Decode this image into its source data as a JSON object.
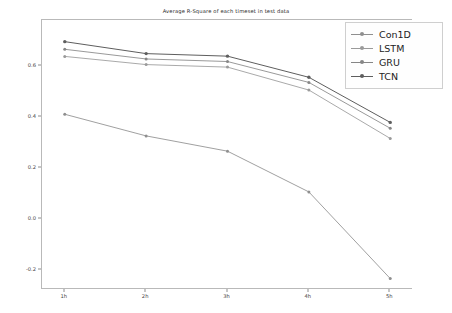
{
  "chart_data": {
    "type": "line",
    "title": "Average R-Square of each timeset in test data",
    "xlabel": "",
    "ylabel": "",
    "categories": [
      "1h",
      "2h",
      "3h",
      "4h",
      "5h"
    ],
    "x_tick_labels": [
      "1h",
      "2h",
      "3h",
      "4h",
      "5h"
    ],
    "y_tick_labels": [
      "0.6",
      "0.4",
      "0.2",
      "0.0",
      "-0.2"
    ],
    "y_tick_values": [
      0.6,
      0.4,
      0.2,
      0.0,
      -0.2
    ],
    "ylim": [
      -0.28,
      0.78
    ],
    "xlim": [
      0.72,
      5.28
    ],
    "grid": false,
    "legend_position": "upper right",
    "marker": "circle",
    "series": [
      {
        "name": "Con1D",
        "color": "#8f8f8f",
        "values": [
          0.41,
          0.325,
          0.265,
          0.105,
          -0.235
        ]
      },
      {
        "name": "LSTM",
        "color": "#9a9a9a",
        "values": [
          0.637,
          0.605,
          0.595,
          0.505,
          0.315
        ]
      },
      {
        "name": "GRU",
        "color": "#868686",
        "values": [
          0.665,
          0.627,
          0.617,
          0.535,
          0.355
        ]
      },
      {
        "name": "TCN",
        "color": "#5e5e5e",
        "values": [
          0.695,
          0.648,
          0.638,
          0.555,
          0.378
        ]
      }
    ]
  },
  "legend": {
    "entries": [
      {
        "label": "Con1D"
      },
      {
        "label": "LSTM"
      },
      {
        "label": "GRU"
      },
      {
        "label": "TCN"
      }
    ]
  },
  "colors": {
    "axis": "#b9b9b9",
    "tick_text": "#3f3f3f",
    "title_text": "#2a2a2a",
    "background": "#ffffff",
    "legend_border": "#cfcfcf"
  }
}
